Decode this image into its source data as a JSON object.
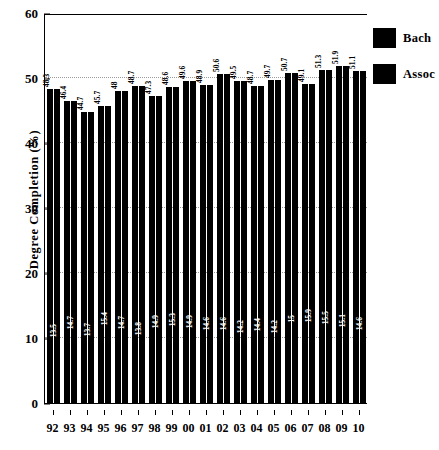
{
  "chart_data": {
    "type": "bar",
    "title": "",
    "xlabel": "",
    "ylabel": "Degree Completion (%)",
    "ylim": [
      0,
      60
    ],
    "yticks": [
      0,
      10,
      20,
      30,
      40,
      50,
      60
    ],
    "grid": true,
    "legend_position": "right",
    "categories": [
      "92",
      "93",
      "94",
      "95",
      "96",
      "97",
      "98",
      "99",
      "00",
      "01",
      "02",
      "03",
      "04",
      "05",
      "06",
      "07",
      "08",
      "09",
      "10"
    ],
    "series": [
      {
        "name": "Bach",
        "color": "#000000",
        "values": [
          48.3,
          46.4,
          44.7,
          45.7,
          48,
          48.7,
          47.3,
          48.6,
          49.6,
          48.9,
          50.6,
          49.5,
          48.7,
          49.7,
          50.7,
          49.1,
          51.3,
          51.9,
          51.1
        ]
      },
      {
        "name": "Assoc",
        "color": "#000000",
        "values": [
          13.5,
          14.7,
          13.7,
          15.4,
          14.7,
          13.8,
          14.9,
          15.3,
          14.9,
          14.6,
          14.6,
          14.2,
          14.4,
          14.2,
          15,
          15.9,
          15.5,
          15.1,
          14.6
        ]
      }
    ]
  },
  "legend": {
    "items": [
      {
        "label": "Bach",
        "color": "#000000"
      },
      {
        "label": "Assoc",
        "color": "#000000"
      }
    ]
  },
  "axes": {
    "y_title": "Degree Completion (%)"
  }
}
